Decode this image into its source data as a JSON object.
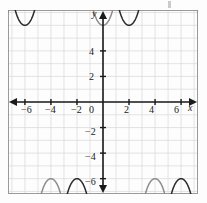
{
  "figure": {
    "kind": "coordinate-plane-graph",
    "background": "#fdfdfd",
    "frame_color": "#9a9a9a",
    "grid_color": "#d8d8d8",
    "axis_color": "#1a1a1a",
    "curve_color_primary": "#2b2b2b",
    "curve_color_secondary": "#8c8c8c",
    "stray_mark": ""
  },
  "axes": {
    "x_axis_label": "x",
    "y_axis_label": "y",
    "origin_label": "0",
    "x_ticks": [
      {
        "value": -6,
        "label": "−6"
      },
      {
        "value": -4,
        "label": "−4"
      },
      {
        "value": -2,
        "label": "−2"
      },
      {
        "value": 2,
        "label": "2"
      },
      {
        "value": 4,
        "label": "4"
      },
      {
        "value": 6,
        "label": "6"
      }
    ],
    "y_ticks": [
      {
        "value": 4,
        "label": "4"
      },
      {
        "value": 2,
        "label": "2"
      },
      {
        "value": -2,
        "label": "−2"
      },
      {
        "value": -4,
        "label": "−4"
      },
      {
        "value": -6,
        "label": "−6"
      }
    ],
    "arrowheads": [
      "left",
      "right",
      "up",
      "down"
    ]
  },
  "chart_data": {
    "type": "line",
    "title": "",
    "xlabel": "x",
    "ylabel": "y",
    "xlim": [
      -7.3,
      7.3
    ],
    "ylim": [
      -7.2,
      7.2
    ],
    "grid": true,
    "grid_step": 1,
    "tick_step": 2,
    "legend": "none",
    "series": [
      {
        "name": "secant-family curve A",
        "color": "#8c8c8c",
        "form": "y = 6 / cos(pi*x/4)  (secant-like, period 8 half-branches)",
        "period": 8,
        "amplitude": 6,
        "asymptotes_x": [
          -6,
          -2,
          2,
          6
        ],
        "branch_extrema": [
          {
            "x": -8,
            "y": -6
          },
          {
            "x": -4,
            "y": 6
          },
          {
            "x": 0,
            "y": -6
          },
          {
            "x": 4,
            "y": 6
          },
          {
            "x": 8,
            "y": -6
          }
        ]
      },
      {
        "name": "secant-family curve B",
        "color": "#2b2b2b",
        "form": "y = 6 / cos(pi*(x-2)/4)  (secant-like, phase shifted 2)",
        "period": 8,
        "amplitude": 6,
        "asymptotes_x": [
          -4,
          0,
          4
        ],
        "branch_extrema": [
          {
            "x": -6,
            "y": -6
          },
          {
            "x": -2,
            "y": 6
          },
          {
            "x": 2,
            "y": -6
          },
          {
            "x": 6,
            "y": 6
          }
        ]
      }
    ]
  }
}
